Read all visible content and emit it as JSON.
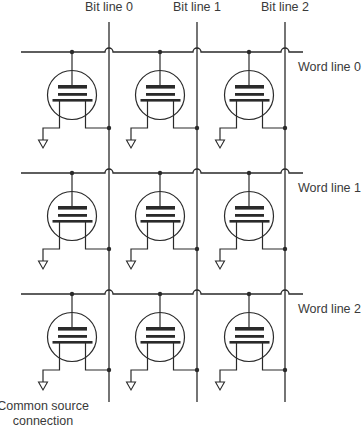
{
  "diagram": {
    "colors": {
      "line": "#2a2a2a",
      "text": "#3a3a3a",
      "background": "#ffffff"
    },
    "bit_lines": [
      {
        "label": "Bit line 0",
        "x": 109
      },
      {
        "label": "Bit line 1",
        "x": 197
      },
      {
        "label": "Bit line 2",
        "x": 285
      }
    ],
    "word_lines": [
      {
        "label": "Word line 0",
        "y": 52
      },
      {
        "label": "Word line 1",
        "y": 173
      },
      {
        "label": "Word line 2",
        "y": 294
      }
    ],
    "cells_per_row": 3,
    "cell_columns_x": [
      72,
      160,
      249
    ],
    "common_source_label": {
      "line1": "Common source",
      "line2": "connection"
    }
  }
}
